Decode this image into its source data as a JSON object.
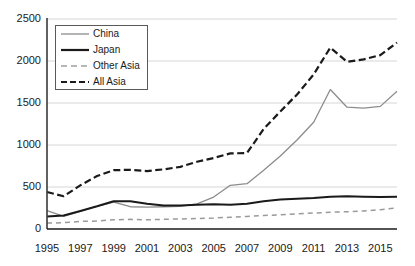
{
  "chart_data": {
    "type": "line",
    "title": "",
    "xlabel": "",
    "ylabel": "",
    "xlim": [
      1995,
      2016
    ],
    "ylim": [
      0,
      2500
    ],
    "ytick_values": [
      0,
      500,
      1000,
      1500,
      2000,
      2500
    ],
    "ytick_labels": [
      "0",
      "500",
      "1000",
      "1500",
      "2000",
      "2500"
    ],
    "xtick_values": [
      1995,
      1997,
      1999,
      2001,
      2003,
      2005,
      2007,
      2009,
      2011,
      2013,
      2015
    ],
    "xtick_labels": [
      "1995",
      "1997",
      "1999",
      "2001",
      "2003",
      "2005",
      "2007",
      "2009",
      "2011",
      "2013",
      "2015"
    ],
    "grid": "horizontal",
    "legend_position": "upper-left-inside",
    "x": [
      1995,
      1996,
      1997,
      1998,
      1999,
      2000,
      2001,
      2002,
      2003,
      2004,
      2005,
      2006,
      2007,
      2008,
      2009,
      2010,
      2011,
      2012,
      2013,
      2014,
      2015,
      2016
    ],
    "series": [
      {
        "name": "China",
        "color": "#8c8c8c",
        "style": "solid",
        "width": 1.3,
        "values": [
          220,
          150,
          210,
          270,
          320,
          265,
          260,
          265,
          270,
          300,
          380,
          520,
          540,
          700,
          870,
          1060,
          1270,
          1660,
          1450,
          1440,
          1460,
          1640
        ]
      },
      {
        "name": "Japan",
        "color": "#1a1a1a",
        "style": "solid",
        "width": 2.0,
        "values": [
          150,
          160,
          215,
          270,
          330,
          330,
          300,
          280,
          280,
          290,
          295,
          290,
          300,
          330,
          350,
          360,
          370,
          385,
          390,
          385,
          380,
          385
        ]
      },
      {
        "name": "Other Asia",
        "color": "#9a9a9a",
        "style": "dashed",
        "width": 1.5,
        "values": [
          70,
          75,
          90,
          95,
          110,
          115,
          110,
          115,
          120,
          125,
          130,
          140,
          150,
          160,
          170,
          180,
          190,
          200,
          205,
          215,
          230,
          250
        ]
      },
      {
        "name": "All Asia",
        "color": "#1a1a1a",
        "style": "dashed",
        "width": 2.2,
        "values": [
          440,
          390,
          520,
          630,
          700,
          705,
          690,
          710,
          740,
          800,
          845,
          900,
          905,
          1190,
          1400,
          1600,
          1840,
          2160,
          1990,
          2020,
          2070,
          2220
        ]
      }
    ]
  },
  "legend": {
    "items": [
      {
        "label": "China",
        "swatch": "thin-solid-gray-line"
      },
      {
        "label": "Japan",
        "swatch": "thick-solid-black-line"
      },
      {
        "label": "Other Asia",
        "swatch": "dashed-gray-line"
      },
      {
        "label": "All Asia",
        "swatch": "thick-dashed-black-line"
      }
    ]
  },
  "axes": {
    "y_axis_color": "#3a3a3a",
    "x_axis_color": "#1a1a1a",
    "grid_color": "#d6d6d6"
  }
}
